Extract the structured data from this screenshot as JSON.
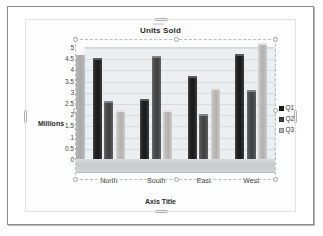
{
  "chart_data": {
    "type": "bar",
    "title": "Units Sold",
    "xlabel": "Axis Title",
    "ylabel": "Millions",
    "categories": [
      "North",
      "South",
      "East",
      "West"
    ],
    "series": [
      {
        "name": "Q1",
        "color": "#1a1a1a",
        "values": [
          4.4,
          2.6,
          3.6,
          4.6
        ]
      },
      {
        "name": "Q2",
        "color": "#414141",
        "values": [
          2.5,
          4.5,
          1.9,
          3.0
        ]
      },
      {
        "name": "Q3",
        "color": "#b2b2b2",
        "values": [
          2.1,
          2.1,
          3.1,
          5.1
        ]
      }
    ],
    "ylim": [
      0,
      5
    ],
    "ytick_labels": [
      "5",
      "4.5",
      "4",
      "3.5",
      "3",
      "2.5",
      "2",
      "1.5",
      "1",
      "0.5",
      "0"
    ],
    "ytick_values": [
      5,
      4.5,
      4,
      3.5,
      3,
      2.5,
      2,
      1.5,
      1,
      0.5,
      0
    ],
    "grid": true,
    "legend_position": "right",
    "three_d": true
  },
  "selection": {
    "plot_area_selected": true,
    "chart_object_selected": true
  }
}
